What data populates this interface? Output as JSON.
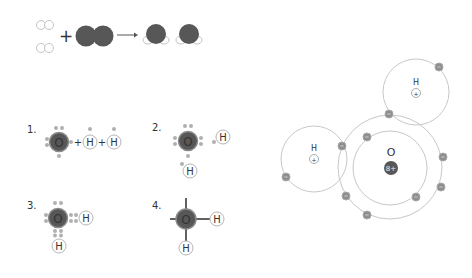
{
  "colors": {
    "oxygen": "#575757",
    "oxygen_edge": "#8a8a8a",
    "hydrogen_fill": "#ffffff",
    "hydrogen_edge": "#b5b5b5",
    "electron": "#8e8e8e",
    "electron_edge": "#a8a8a8",
    "dot": "#b0b0b0",
    "orbit": "#c8c8c8",
    "text": "#333333",
    "bond": "#3a3a3a"
  },
  "reaction": {
    "plus": "+",
    "arrow": "→",
    "reactant_h2": [
      {
        "x": 45,
        "y": 25
      },
      {
        "x": 45,
        "y": 48
      }
    ],
    "reactant_o2": [
      {
        "x": 86,
        "y": 36
      },
      {
        "x": 103,
        "y": 36
      }
    ],
    "products_h2o": [
      {
        "x": 156,
        "y": 35
      },
      {
        "x": 189,
        "y": 35
      }
    ]
  },
  "steps": [
    {
      "number": "1.",
      "oxygen_symbol": "O",
      "hydrogen_symbol": "H",
      "plus": "+"
    },
    {
      "number": "2.",
      "oxygen_symbol": "O",
      "hydrogen_symbol": "H"
    },
    {
      "number": "3.",
      "oxygen_symbol": "O",
      "hydrogen_symbol": "H"
    },
    {
      "number": "4.",
      "oxygen_symbol": "O",
      "hydrogen_symbol": "H"
    }
  ],
  "bohr_model": {
    "oxygen": {
      "label": "O",
      "nucleus_charge": "8+",
      "x": 391,
      "y": 168,
      "inner_shell_r": 37,
      "outer_shell_r": 52
    },
    "hydrogen_atoms": [
      {
        "label": "H",
        "nucleus_charge": "+",
        "x": 416,
        "y": 92,
        "shell_r": 33
      },
      {
        "label": "H",
        "nucleus_charge": "+",
        "x": 314,
        "y": 159,
        "shell_r": 33
      }
    ],
    "electron_sign": "–",
    "electrons": [
      {
        "x": 439,
        "y": 67
      },
      {
        "x": 389,
        "y": 114
      },
      {
        "x": 367,
        "y": 137
      },
      {
        "x": 342,
        "y": 146
      },
      {
        "x": 286,
        "y": 177
      },
      {
        "x": 443,
        "y": 157
      },
      {
        "x": 441,
        "y": 187
      },
      {
        "x": 416,
        "y": 197
      },
      {
        "x": 346,
        "y": 196
      },
      {
        "x": 367,
        "y": 215
      }
    ]
  }
}
